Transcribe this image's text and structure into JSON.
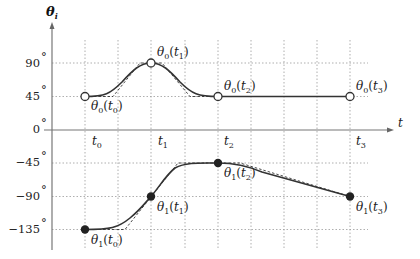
{
  "diagram": {
    "y_axis_title": "θ",
    "y_axis_title_sub": "i",
    "x_axis_title": "t",
    "y_ticks": [
      {
        "label": "90",
        "deg": 90
      },
      {
        "label": "45",
        "deg": 45
      },
      {
        "label": "0",
        "deg": 0
      },
      {
        "label": "−45",
        "deg": -45
      },
      {
        "label": "−90",
        "deg": -90
      },
      {
        "label": "−135",
        "deg": -135
      }
    ],
    "degree_symbol": "°",
    "x_ticks": [
      {
        "label": "t",
        "sub": "0"
      },
      {
        "label": "t",
        "sub": "1"
      },
      {
        "label": "t",
        "sub": "2"
      },
      {
        "label": "t",
        "sub": "3"
      }
    ],
    "series": [
      {
        "name": "theta0",
        "marker": "open-circle",
        "points": [
          {
            "t": "t0",
            "deg": 45,
            "label": "θ",
            "sub": "0",
            "arg": "t",
            "argsub": "0"
          },
          {
            "t": "t1",
            "deg": 90,
            "label": "θ",
            "sub": "0",
            "arg": "t",
            "argsub": "1"
          },
          {
            "t": "t2",
            "deg": 45,
            "label": "θ",
            "sub": "0",
            "arg": "t",
            "argsub": "2"
          },
          {
            "t": "t3",
            "deg": 45,
            "label": "θ",
            "sub": "0",
            "arg": "t",
            "argsub": "3"
          }
        ]
      },
      {
        "name": "theta1",
        "marker": "filled-circle",
        "points": [
          {
            "t": "t0",
            "deg": -135,
            "label": "θ",
            "sub": "1",
            "arg": "t",
            "argsub": "0"
          },
          {
            "t": "t1",
            "deg": -90,
            "label": "θ",
            "sub": "1",
            "arg": "t",
            "argsub": "1"
          },
          {
            "t": "t2",
            "deg": -45,
            "label": "θ",
            "sub": "1",
            "arg": "t",
            "argsub": "2"
          },
          {
            "t": "t3",
            "deg": -90,
            "label": "θ",
            "sub": "1",
            "arg": "t",
            "argsub": "3"
          }
        ]
      }
    ]
  }
}
